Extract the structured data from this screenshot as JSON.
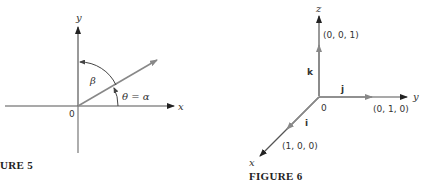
{
  "figure5": {
    "caption": "URE 5",
    "y_axis_label": "y",
    "x_axis_label": "x",
    "origin_label": "0",
    "beta_label": "β",
    "theta_label": "θ = α"
  },
  "figure6": {
    "caption": "FIGURE 6",
    "z_axis_label": "z",
    "y_axis_label": "y",
    "x_axis_label": "x",
    "origin_label": "0",
    "k_label": "k",
    "j_label": "j",
    "i_label": "i",
    "k_point": "(0, 0, 1)",
    "j_point": "(0, 1, 0)",
    "i_point": "(1, 0, 0)"
  },
  "colors": {
    "axis": "#333333",
    "vector": "#888888"
  }
}
